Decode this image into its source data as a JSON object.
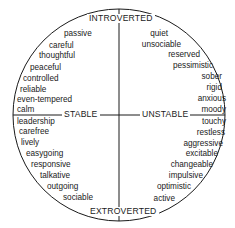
{
  "axes": {
    "top": "INTROVERTED",
    "bottom": "EXTROVERTED",
    "left": "STABLE",
    "right": "UNSTABLE"
  },
  "quadrants": {
    "stable_introverted": [
      "passive",
      "careful",
      "thoughtful",
      "peaceful",
      "controlled",
      "reliable",
      "even-tempered",
      "calm"
    ],
    "unstable_introverted": [
      "quiet",
      "unsociable",
      "reserved",
      "pessimistic",
      "sober",
      "rigid",
      "anxious",
      "moody"
    ],
    "stable_extroverted": [
      "leadership",
      "carefree",
      "lively",
      "easygoing",
      "responsive",
      "talkative",
      "outgoing",
      "sociable"
    ],
    "unstable_extroverted": [
      "touchy",
      "restless",
      "aggressive",
      "excitable",
      "changeable",
      "impulsive",
      "optimistic",
      "active"
    ]
  },
  "colors": {
    "line": "#1a1a1a",
    "text": "#1a1a1a",
    "background": "#ffffff"
  }
}
